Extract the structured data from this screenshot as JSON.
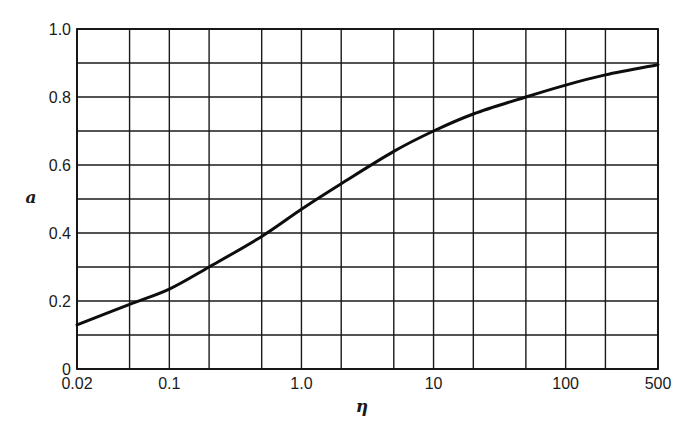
{
  "chart_data": {
    "type": "line",
    "title": "",
    "xlabel": "η",
    "ylabel": "a",
    "xscale": "log",
    "xlim": [
      0.02,
      500
    ],
    "ylim": [
      0,
      1.0
    ],
    "grid": true,
    "legend": null,
    "x_ticks": [
      {
        "value": 0.02,
        "label": "0.02"
      },
      {
        "value": 0.1,
        "label": "0.1"
      },
      {
        "value": 1.0,
        "label": "1.0"
      },
      {
        "value": 10,
        "label": "10"
      },
      {
        "value": 100,
        "label": "100"
      },
      {
        "value": 500,
        "label": "500"
      }
    ],
    "y_ticks": [
      {
        "value": 0,
        "label": "0"
      },
      {
        "value": 0.2,
        "label": "0.2"
      },
      {
        "value": 0.4,
        "label": "0.4"
      },
      {
        "value": 0.6,
        "label": "0.6"
      },
      {
        "value": 0.8,
        "label": "0.8"
      },
      {
        "value": 1.0,
        "label": "1.0"
      }
    ],
    "x_gridlines": [
      0.02,
      0.05,
      0.1,
      0.2,
      0.5,
      1,
      2,
      5,
      10,
      20,
      50,
      100,
      200,
      500
    ],
    "y_gridlines": [
      0,
      0.1,
      0.2,
      0.3,
      0.4,
      0.5,
      0.6,
      0.7,
      0.8,
      0.9,
      1.0
    ],
    "series": [
      {
        "name": "a vs η",
        "x": [
          0.02,
          0.05,
          0.1,
          0.2,
          0.5,
          1,
          2,
          5,
          10,
          20,
          50,
          100,
          200,
          500
        ],
        "values": [
          0.13,
          0.19,
          0.235,
          0.3,
          0.39,
          0.47,
          0.545,
          0.64,
          0.7,
          0.75,
          0.8,
          0.835,
          0.865,
          0.895
        ]
      }
    ]
  }
}
